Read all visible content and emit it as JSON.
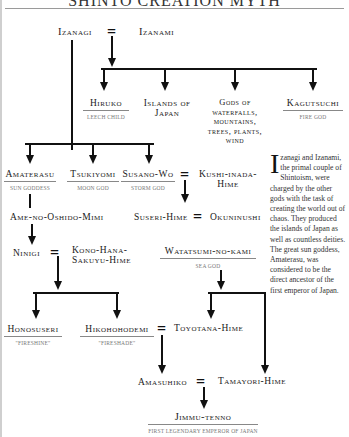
{
  "title": "SHINTO CREATION MYTH",
  "equals_symbol": "=",
  "nodes": {
    "izanagi": {
      "name": "Izanagi"
    },
    "izanami": {
      "name": "Izanami"
    },
    "hiruko": {
      "name": "Hiruko",
      "subtitle": "Leech child"
    },
    "islands": {
      "line1": "Islands of",
      "line2": "Japan"
    },
    "gods": {
      "line1": "Gods of",
      "line2": "waterfalls,",
      "line3": "mountains,",
      "line4": "trees, plants,",
      "line5": "wind"
    },
    "kagutsuchi": {
      "name": "Kagutsuchi",
      "subtitle": "Fire god"
    },
    "amaterasu": {
      "name": "Amaterasu",
      "subtitle": "Sun goddess"
    },
    "tsukiyomi": {
      "name": "Tsukiyomi",
      "subtitle": "Moon god"
    },
    "susano": {
      "name": "Susano-Wo",
      "subtitle": "Storm god"
    },
    "kushi": {
      "line1": "Kushi-inada-",
      "line2": "Hime"
    },
    "ame": {
      "name": "Ame-no-Oshido-Mimi"
    },
    "suseri": {
      "name": "Suseri-Hime"
    },
    "okuninushi": {
      "name": "Okuninushi"
    },
    "ninigi": {
      "name": "Ninigi"
    },
    "kono": {
      "line1": "Kono-Hana-",
      "line2": "Sakuyu-Hime"
    },
    "watatsumi": {
      "name": "Watatsumi-no-kami",
      "subtitle": "Sea god"
    },
    "honosuseri": {
      "name": "Honosuseri",
      "subtitle": "\"Fireshine\""
    },
    "hikohohodemi": {
      "name": "Hikohohodemi",
      "subtitle": "\"Fireshade\""
    },
    "toyotana": {
      "name": "Toyotana-Hime"
    },
    "amasuhiko": {
      "name": "Amasuhiko"
    },
    "tamayori": {
      "name": "Tamayori-Hime"
    },
    "jimmu": {
      "name": "Jimmu-tenno",
      "subtitle": "First legendary emperor of Japan"
    }
  },
  "sidebar_text": {
    "dropcap": "I",
    "body": "zanagi and Izanami, the primal couple of Shintoism, were charged by the other gods with the task of creating the world out of chaos. They produced the islands of Japan as well as countless deities. The great sun goddess, Amaterasu, was considered to be the direct ancestor of the first emperor of Japan."
  },
  "colors": {
    "line": "#111111",
    "subtitle_text": "#777777",
    "rule": "#888888"
  }
}
